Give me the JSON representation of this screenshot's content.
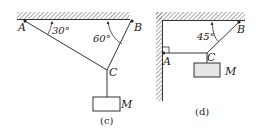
{
  "figures": [
    {
      "caption": "(c)",
      "points": {
        "A": "A",
        "B": "B",
        "C": "C"
      },
      "mass_label": "M",
      "angles": [
        "30°",
        "60°"
      ]
    },
    {
      "caption": "(d)",
      "points": {
        "A": "A",
        "B": "B",
        "C": "C"
      },
      "mass_label": "M",
      "angles": [
        "45°"
      ]
    }
  ],
  "colors": {
    "line": "#333333",
    "hatch": "#555555",
    "box_fill": "#e6e6e6"
  }
}
